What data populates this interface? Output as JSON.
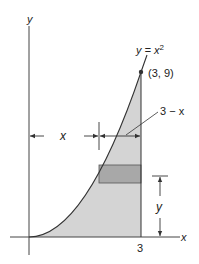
{
  "figure": {
    "curve_label": "y = x",
    "curve_label_exp": "2",
    "point_label": "(3, 9)",
    "strip_label": "3 − x",
    "x_distance_label": "x",
    "y_height_label": "y",
    "x_axis_label": "x",
    "y_axis_label": "y",
    "x_tick_label": "3"
  },
  "colors": {
    "region_fill": "#d4d4d4",
    "strip_fill": "#a8a8a8",
    "line": "#333333"
  }
}
